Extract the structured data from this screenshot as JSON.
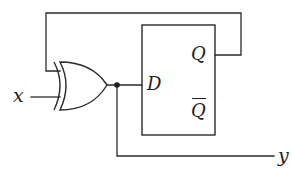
{
  "diagram": {
    "type": "logic-circuit",
    "components": [
      {
        "id": "xor-gate",
        "kind": "XOR gate",
        "inputs": [
          "feedback from Q",
          "x"
        ],
        "output": "D"
      },
      {
        "id": "d-flip-flop",
        "kind": "D flip-flop",
        "input_label": "D",
        "outputs": [
          "Q",
          "Q-bar"
        ]
      }
    ],
    "labels": {
      "input_x": "x",
      "flipflop_d": "D",
      "flipflop_q": "Q",
      "flipflop_qbar": "Q",
      "output_y": "y"
    },
    "connections": [
      "Q -> XOR input 1 (feedback loop over top)",
      "x -> XOR input 2",
      "XOR output -> D",
      "XOR output (junction) -> y"
    ],
    "colors": {
      "line": "#2a2a2a",
      "background": "#ffffff"
    }
  }
}
